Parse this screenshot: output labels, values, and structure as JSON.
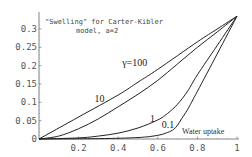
{
  "chart_data": {
    "type": "line",
    "title": "\"Swelling\" for Carter-Kibler model, a=2",
    "title_lines": [
      "\"Swelling\" for Carter-Kibler",
      "model, a=2"
    ],
    "xlabel": "Water uptake",
    "ylabel": "",
    "xlim": [
      0,
      1
    ],
    "ylim": [
      0,
      0.34
    ],
    "xticks": [
      0.2,
      0.4,
      0.6,
      0.8,
      1
    ],
    "xtick_labels": [
      "0.2",
      "0.4",
      "0.6",
      "0.8",
      "1"
    ],
    "yticks": [
      0,
      0.05,
      0.1,
      0.15,
      0.2,
      0.25,
      0.3
    ],
    "ytick_labels": [
      "0",
      "0.05",
      "0.1",
      "0.15",
      "0.2",
      "0.25",
      "0.3"
    ],
    "grid": false,
    "legend": "inline curve labels",
    "series": [
      {
        "name": "γ=100",
        "label": "γ=100",
        "label_pos": [
          0.42,
          0.2
        ],
        "x": [
          0,
          0.2,
          0.4,
          0.5,
          0.6,
          0.8,
          0.9,
          1
        ],
        "y": [
          0,
          0.06,
          0.12,
          0.155,
          0.19,
          0.265,
          0.3,
          0.335
        ]
      },
      {
        "name": "γ=10",
        "label": "10",
        "label_pos": [
          0.28,
          0.1
        ],
        "x": [
          0,
          0.1,
          0.2,
          0.3,
          0.4,
          0.5,
          0.6,
          0.7,
          0.8,
          0.9,
          1
        ],
        "y": [
          0,
          0.008,
          0.028,
          0.055,
          0.088,
          0.122,
          0.16,
          0.205,
          0.25,
          0.292,
          0.335
        ]
      },
      {
        "name": "γ=1",
        "label": "1",
        "label_pos": [
          0.56,
          0.045
        ],
        "x": [
          0,
          0.2,
          0.3,
          0.4,
          0.5,
          0.6,
          0.65,
          0.7,
          0.75,
          0.8,
          0.9,
          1
        ],
        "y": [
          0,
          0.003,
          0.008,
          0.016,
          0.03,
          0.052,
          0.07,
          0.095,
          0.13,
          0.175,
          0.255,
          0.335
        ]
      },
      {
        "name": "γ=0.1",
        "label": "0.1",
        "label_pos": [
          0.62,
          0.03
        ],
        "x": [
          0,
          0.3,
          0.5,
          0.6,
          0.65,
          0.68,
          0.7,
          0.72,
          0.75,
          0.8,
          0.9,
          1
        ],
        "y": [
          0,
          0.001,
          0.004,
          0.01,
          0.018,
          0.026,
          0.038,
          0.055,
          0.08,
          0.13,
          0.232,
          0.335
        ]
      }
    ]
  }
}
